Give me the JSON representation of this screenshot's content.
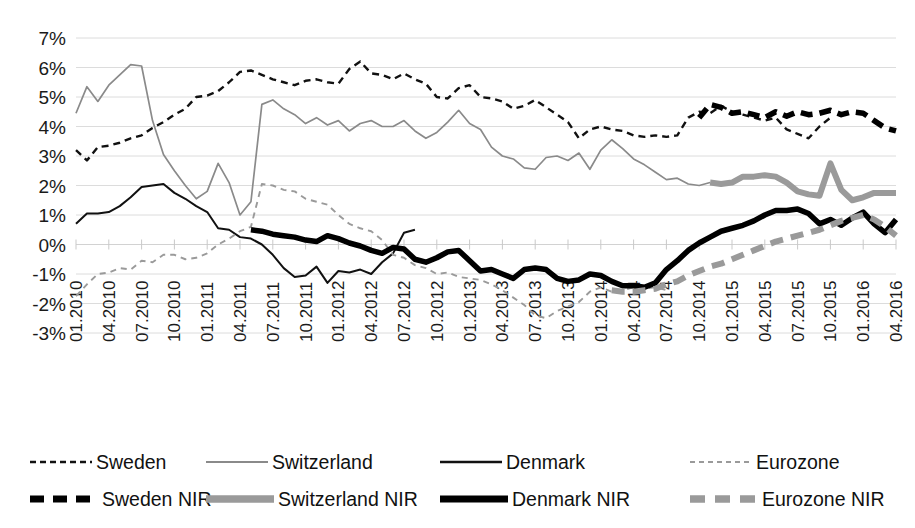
{
  "top_cropped_text": "",
  "chart_data": {
    "type": "line",
    "title": "",
    "xlabel": "",
    "ylabel": "",
    "ylim": [
      -3,
      7
    ],
    "ytick_labels": [
      "7%",
      "6%",
      "5%",
      "4%",
      "3%",
      "2%",
      "1%",
      "0%",
      "-1%",
      "-2%",
      "-3%"
    ],
    "ytick_values": [
      7,
      6,
      5,
      4,
      3,
      2,
      1,
      0,
      -1,
      -2,
      -3
    ],
    "grid": true,
    "legend_position": "bottom",
    "xtick_labels": [
      "01.2010",
      "04.2010",
      "07.2010",
      "10.2010",
      "01.2011",
      "04.2011",
      "07.2011",
      "10.2011",
      "01.2012",
      "04.2012",
      "07.2012",
      "10.2012",
      "01.2013",
      "04.2013",
      "07.2013",
      "10.2013",
      "01.2014",
      "04.2014",
      "07.2014",
      "10.2014",
      "01.2015",
      "04.2015",
      "07.2015",
      "10.2015",
      "01.2016",
      "04.2016"
    ],
    "x_start": "01.2010",
    "x_end": "04.2016",
    "x_step_months": 1,
    "n_points": 76,
    "series": [
      {
        "name": "Sweden",
        "style": "dashed-thin",
        "color": "#111111",
        "width": 2.4,
        "dash": "7,5",
        "segment": "pre-nir",
        "values": [
          3.2,
          2.85,
          3.3,
          3.35,
          3.45,
          3.6,
          3.7,
          3.95,
          4.15,
          4.4,
          4.6,
          5.0,
          5.05,
          5.2,
          5.5,
          5.85,
          5.9,
          5.75,
          5.6,
          5.5,
          5.4,
          5.55,
          5.6,
          5.5,
          5.45,
          5.95,
          6.2,
          5.8,
          5.75,
          5.6,
          5.8,
          5.6,
          5.45,
          5.0,
          4.95,
          5.3,
          5.4,
          5.0,
          4.95,
          4.85,
          4.6,
          4.7,
          4.9,
          4.65,
          4.4,
          4.15,
          3.6,
          3.9,
          4.0,
          3.9,
          3.85,
          3.7,
          3.65,
          3.7,
          3.65,
          3.7,
          4.3,
          4.5,
          4.45,
          4.7,
          4.5,
          4.4,
          4.3,
          4.2,
          4.3,
          3.9,
          3.75,
          3.6,
          4.0,
          4.3
        ]
      },
      {
        "name": "Switzerland",
        "style": "solid-thin",
        "color": "#8a8a8a",
        "width": 1.7,
        "dash": "none",
        "segment": "pre-nir",
        "values": [
          4.45,
          5.35,
          4.85,
          5.4,
          5.75,
          6.1,
          6.05,
          4.2,
          3.05,
          2.5,
          2.0,
          1.55,
          1.8,
          2.75,
          2.1,
          1.0,
          1.45,
          4.75,
          4.9,
          4.6,
          4.4,
          4.1,
          4.3,
          4.05,
          4.2,
          3.85,
          4.1,
          4.2,
          4.0,
          4.0,
          4.2,
          3.85,
          3.6,
          3.8,
          4.15,
          4.55,
          4.1,
          3.9,
          3.3,
          3.0,
          2.9,
          2.6,
          2.55,
          2.95,
          3.0,
          2.85,
          3.1,
          2.55,
          3.2,
          3.55,
          3.25,
          2.9,
          2.7,
          2.45,
          2.2,
          2.25,
          2.05,
          2.0,
          2.1
        ]
      },
      {
        "name": "Denmark",
        "style": "solid-thin",
        "color": "#111111",
        "width": 2.0,
        "dash": "none",
        "segment": "pre-nir",
        "values": [
          0.7,
          1.05,
          1.05,
          1.1,
          1.3,
          1.6,
          1.95,
          2.0,
          2.05,
          1.75,
          1.55,
          1.3,
          1.1,
          0.55,
          0.5,
          0.25,
          0.2,
          0.0,
          -0.35,
          -0.8,
          -1.1,
          -1.05,
          -0.75,
          -1.3,
          -0.9,
          -0.95,
          -0.85,
          -1.0,
          -0.6,
          -0.3,
          0.4,
          0.5
        ]
      },
      {
        "name": "Eurozone",
        "style": "dashed-light",
        "color": "#9a9a9a",
        "width": 1.9,
        "dash": "6,5",
        "segment": "pre-nir",
        "values": [
          -1.75,
          -1.35,
          -1.0,
          -0.95,
          -0.8,
          -0.85,
          -0.55,
          -0.6,
          -0.35,
          -0.35,
          -0.5,
          -0.45,
          -0.3,
          0.0,
          0.2,
          0.45,
          0.6,
          2.05,
          2.0,
          1.85,
          1.8,
          1.55,
          1.45,
          1.35,
          1.0,
          0.7,
          0.55,
          0.45,
          0.15,
          -0.35,
          -0.45,
          -0.7,
          -0.8,
          -1.0,
          -0.95,
          -1.1,
          -1.15,
          -1.2,
          -1.35,
          -1.55,
          -1.8,
          -2.05,
          -2.4,
          -2.5,
          -2.25,
          -2.1,
          -1.95,
          -1.6,
          -1.45,
          -1.6,
          -1.55,
          -1.45,
          -1.5,
          -1.45,
          -1.55
        ]
      },
      {
        "name": "Sweden NIR",
        "style": "dashed-thick",
        "color": "#000000",
        "width": 5.5,
        "dash": "12,7",
        "segment": "nir",
        "start_label": "02.2015",
        "values": [
          4.3,
          4.75,
          4.65,
          4.45,
          4.5,
          4.4,
          4.3,
          4.5,
          4.35,
          4.5,
          4.4,
          4.45,
          4.55,
          4.4,
          4.5,
          4.45,
          4.2,
          3.95,
          3.85
        ]
      },
      {
        "name": "Switzerland NIR",
        "style": "solid-thick",
        "color": "#9a9a9a",
        "width": 6.0,
        "dash": "none",
        "segment": "nir",
        "start_label": "01.2015",
        "values": [
          2.1,
          2.05,
          2.1,
          2.3,
          2.3,
          2.35,
          2.3,
          2.1,
          1.8,
          1.7,
          1.65,
          2.75,
          1.85,
          1.5,
          1.6,
          1.75,
          1.75,
          1.75
        ]
      },
      {
        "name": "Denmark NIR",
        "style": "solid-thick",
        "color": "#000000",
        "width": 5.5,
        "dash": "none",
        "segment": "nir",
        "start_label": "07.2012",
        "values": [
          0.5,
          0.45,
          0.35,
          0.3,
          0.25,
          0.15,
          0.1,
          0.3,
          0.2,
          0.05,
          -0.05,
          -0.2,
          -0.3,
          -0.1,
          -0.15,
          -0.5,
          -0.6,
          -0.45,
          -0.25,
          -0.2,
          -0.55,
          -0.9,
          -0.85,
          -1.0,
          -1.15,
          -0.85,
          -0.8,
          -0.85,
          -1.15,
          -1.25,
          -1.2,
          -1.0,
          -1.05,
          -1.25,
          -1.4,
          -1.4,
          -1.45,
          -1.3,
          -0.85,
          -0.55,
          -0.2,
          0.05,
          0.25,
          0.45,
          0.55,
          0.65,
          0.8,
          1.0,
          1.15,
          1.15,
          1.2,
          1.05,
          0.7,
          0.85,
          0.65,
          0.9,
          1.1,
          0.7,
          0.4,
          0.85
        ]
      },
      {
        "name": "Eurozone NIR",
        "style": "dashed-thick",
        "color": "#9a9a9a",
        "width": 6.0,
        "dash": "13,8",
        "segment": "nir",
        "start_label": "06.2014",
        "values": [
          -1.55,
          -1.6,
          -1.6,
          -1.55,
          -1.5,
          -1.35,
          -1.25,
          -1.05,
          -0.9,
          -0.75,
          -0.65,
          -0.5,
          -0.35,
          -0.2,
          -0.05,
          0.1,
          0.2,
          0.3,
          0.4,
          0.5,
          0.65,
          0.8,
          0.9,
          1.0,
          0.85,
          0.6,
          0.3
        ]
      }
    ]
  },
  "legend": {
    "row1": [
      {
        "label": "Sweden",
        "key": "sweden"
      },
      {
        "label": "Switzerland",
        "key": "switzerland"
      },
      {
        "label": "Denmark",
        "key": "denmark"
      },
      {
        "label": "Eurozone",
        "key": "eurozone"
      }
    ],
    "row2": [
      {
        "label": "Sweden NIR",
        "key": "sweden-nir"
      },
      {
        "label": "Switzerland NIR",
        "key": "switzerland-nir"
      },
      {
        "label": "Denmark NIR",
        "key": "denmark-nir"
      },
      {
        "label": "Eurozone NIR",
        "key": "eurozone-nir"
      }
    ]
  },
  "colors": {
    "black": "#111111",
    "gray": "#9a9a9a",
    "grid": "#dcdcdc",
    "background": "#ffffff"
  }
}
